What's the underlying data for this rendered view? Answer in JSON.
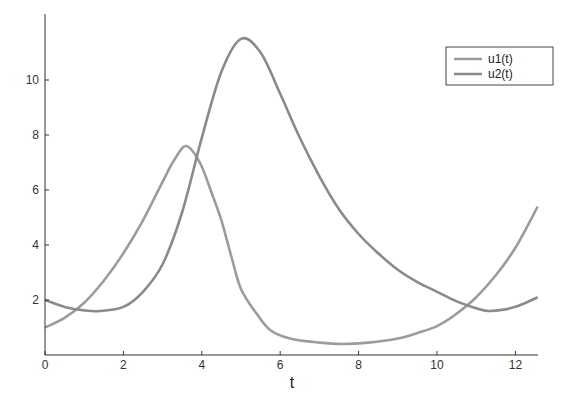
{
  "chart_data": {
    "type": "line",
    "title": "",
    "xlabel": "t",
    "ylabel": "",
    "xlim": [
      0,
      12.57
    ],
    "ylim": [
      0,
      11.8
    ],
    "xticks": [
      0,
      2,
      4,
      6,
      8,
      10,
      12
    ],
    "yticks": [
      2,
      4,
      6,
      8,
      10
    ],
    "grid": false,
    "legend_position": "upper right",
    "series": [
      {
        "name": "u1(t)",
        "color": "#9c9c9c",
        "x": [
          0,
          0.5,
          1,
          1.5,
          2,
          2.5,
          3,
          3.3,
          3.6,
          3.95,
          4.25,
          4.5,
          4.75,
          5,
          5.4,
          5.75,
          6.25,
          7,
          7.6,
          8.25,
          9,
          9.5,
          10,
          10.5,
          11,
          11.5,
          12,
          12.57
        ],
        "y": [
          1.0,
          1.35,
          1.9,
          2.7,
          3.7,
          4.9,
          6.3,
          7.1,
          7.6,
          7.0,
          5.9,
          4.9,
          3.6,
          2.4,
          1.5,
          0.9,
          0.6,
          0.45,
          0.4,
          0.45,
          0.6,
          0.8,
          1.05,
          1.5,
          2.1,
          2.9,
          3.9,
          5.4
        ]
      },
      {
        "name": "u2(t)",
        "color": "#8a8a8a",
        "x": [
          0,
          0.5,
          1,
          1.4,
          2,
          2.5,
          3,
          3.5,
          4,
          4.5,
          5,
          5.5,
          6,
          6.5,
          7,
          7.5,
          8,
          8.5,
          9,
          9.5,
          10,
          10.5,
          11,
          11.3,
          11.7,
          12.1,
          12.57
        ],
        "y": [
          2.0,
          1.75,
          1.62,
          1.6,
          1.75,
          2.3,
          3.3,
          5.2,
          7.9,
          10.3,
          11.5,
          11.0,
          9.5,
          7.9,
          6.5,
          5.3,
          4.4,
          3.7,
          3.1,
          2.65,
          2.3,
          1.95,
          1.7,
          1.6,
          1.65,
          1.8,
          2.1
        ]
      }
    ]
  }
}
